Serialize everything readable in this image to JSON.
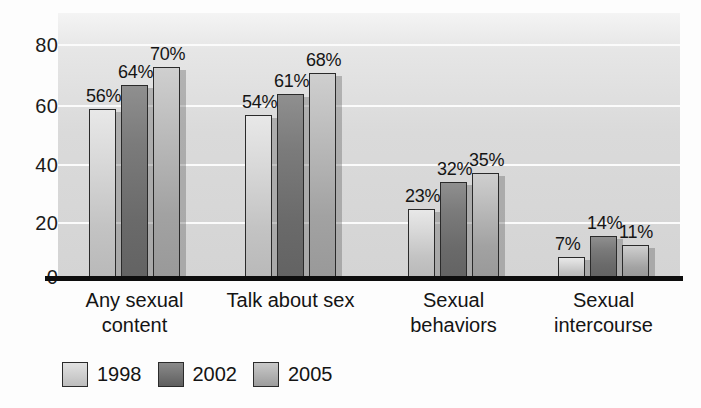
{
  "chart_data": {
    "type": "bar",
    "title": "",
    "subtitle": "",
    "xlabel": "",
    "ylabel": "",
    "ylim": [
      0,
      88
    ],
    "yticks": [
      0,
      20,
      40,
      60,
      80
    ],
    "ytick_labels": [
      "0",
      "20",
      "40",
      "60",
      "80"
    ],
    "grid": true,
    "legend_position": "bottom-left",
    "categories": [
      "Any sexual\ncontent",
      "Talk about sex",
      "Sexual\nbehaviors",
      "Sexual\nintercourse"
    ],
    "series": [
      {
        "name": "1998",
        "color": "#d2d2d2",
        "values": [
          56,
          54,
          23,
          7
        ],
        "data_labels": [
          "56%",
          "54%",
          "23%",
          "7%"
        ]
      },
      {
        "name": "2002",
        "color": "#6f6f6f",
        "values": [
          64,
          61,
          32,
          14
        ],
        "data_labels": [
          "64%",
          "61%",
          "32%",
          "14%"
        ]
      },
      {
        "name": "2005",
        "color": "#ababab",
        "values": [
          70,
          68,
          35,
          11
        ],
        "data_labels": [
          "70%",
          "68%",
          "35%",
          "11%"
        ]
      }
    ]
  },
  "legend": {
    "items": [
      {
        "label": "1998",
        "swatch": "y1998"
      },
      {
        "label": "2002",
        "swatch": "y2002"
      },
      {
        "label": "2005",
        "swatch": "y2005"
      }
    ]
  }
}
